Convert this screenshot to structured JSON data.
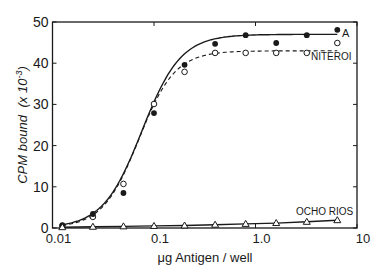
{
  "chart_data": {
    "type": "line",
    "title": "",
    "xlabel": "μg Antigen / well",
    "ylabel": "CPM bound (x 10⁻³)",
    "xscale": "log",
    "xlim": [
      0.01,
      10
    ],
    "ylim": [
      0,
      50
    ],
    "x_ticks": [
      "0.01",
      "0.1",
      "1.0",
      "10"
    ],
    "y_ticks": [
      "0",
      "10",
      "20",
      "30",
      "40",
      "50"
    ],
    "grid": false,
    "legend": "inline labels at right end of curves",
    "x": [
      0.0125,
      0.025,
      0.05,
      0.1,
      0.2,
      0.4,
      0.8,
      1.6,
      3.2,
      6.4
    ],
    "series": [
      {
        "name": "A",
        "marker": "filled-circle",
        "line": "solid",
        "values": [
          0.7,
          3.4,
          8.5,
          27.9,
          39.6,
          44.7,
          46.8,
          44.9,
          46.8,
          48.1
        ],
        "fit_line_end": 47
      },
      {
        "name": "NITEROI",
        "marker": "open-circle",
        "line": "dashed",
        "values": [
          0.5,
          2.7,
          10.7,
          30.1,
          37.9,
          42.5,
          42.5,
          42.5,
          42.5,
          44.9
        ],
        "fit_line_end": 43
      },
      {
        "name": "OCHO RIOS",
        "marker": "open-triangle",
        "line": "solid",
        "values": [
          0.2,
          0.3,
          0.4,
          0.5,
          0.6,
          0.8,
          1.0,
          1.2,
          1.5,
          1.9
        ]
      }
    ]
  },
  "labels": {
    "series_a": "A",
    "series_niteroi": "NITEROI",
    "series_ocho_rios": "OCHO RIOS",
    "xlabel": "μg Antigen / well",
    "ylabel_main": "CPM bound",
    "ylabel_unit": "(x 10",
    "ylabel_exp": "-3",
    "ylabel_close": ")"
  }
}
